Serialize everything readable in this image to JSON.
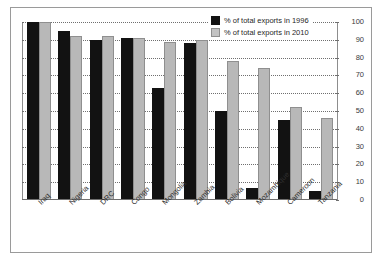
{
  "top_remnant_text": "",
  "legend": {
    "position": "top-right",
    "entries": [
      {
        "label": "% of total exports in 1996",
        "color": "#121212",
        "swatch": "legend-swatch-1996"
      },
      {
        "label": "% of total exports in 2010",
        "color": "#c3c3c3",
        "swatch": "legend-swatch-2010"
      }
    ]
  },
  "chart_data": {
    "type": "bar",
    "title": "",
    "xlabel": "",
    "ylabel": "",
    "ylim": [
      0,
      100
    ],
    "yticks": [
      0,
      10,
      20,
      30,
      40,
      50,
      60,
      70,
      80,
      90,
      100
    ],
    "y_axis_position": "right",
    "grid": true,
    "grid_style": "dotted-horizontal",
    "legend_position": "top-right",
    "categories": [
      "Iraq",
      "Nigeria",
      "DRC",
      "Congo",
      "Mongolia",
      "Zambia",
      "Bolivia",
      "Mozambique",
      "Cameroon",
      "Tanzania"
    ],
    "series": [
      {
        "name": "% of total exports in 1996",
        "color": "#121212",
        "values": [
          100,
          95,
          90,
          91,
          63,
          88,
          50,
          7,
          45,
          5
        ]
      },
      {
        "name": "% of total exports in 2010",
        "color": "#c3c3c3",
        "values": [
          100,
          92,
          92,
          91,
          89,
          90,
          78,
          74,
          52,
          46
        ]
      }
    ]
  }
}
